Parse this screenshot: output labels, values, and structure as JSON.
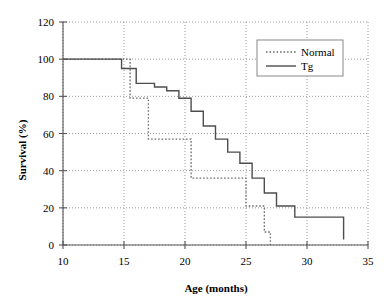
{
  "chart_data": {
    "type": "line",
    "title": "",
    "xlabel": "Age (months)",
    "ylabel": "Survival (%)",
    "xlim": [
      10,
      35
    ],
    "ylim": [
      0,
      120
    ],
    "xticks": [
      10,
      15,
      20,
      25,
      30,
      35
    ],
    "yticks": [
      0,
      20,
      40,
      60,
      80,
      100,
      120
    ],
    "grid": true,
    "legend_position": "top-right",
    "step_style": "post",
    "series": [
      {
        "name": "Normal",
        "style": "dotted",
        "color": "#6b6b6b",
        "x": [
          10,
          15,
          15.5,
          16,
          17,
          19,
          20.5,
          24,
          25,
          26,
          26.5,
          27
        ],
        "y": [
          100,
          100,
          79,
          79,
          57,
          57,
          36,
          36,
          21,
          21,
          7,
          0
        ]
      },
      {
        "name": "Tg",
        "style": "solid",
        "color": "#4d4d4d",
        "x": [
          10,
          14.8,
          16,
          17.5,
          18.5,
          19.5,
          20.5,
          21.5,
          22.5,
          23.5,
          24.5,
          25.5,
          26.5,
          27.5,
          29,
          33
        ],
        "y": [
          100,
          95,
          87,
          85,
          83,
          79,
          72,
          64,
          57,
          50,
          44,
          36,
          28,
          21,
          15,
          3
        ]
      }
    ]
  },
  "axes": {
    "y_tick_labels": [
      "0",
      "20",
      "40",
      "60",
      "80",
      "100",
      "120"
    ],
    "x_tick_labels": [
      "10",
      "15",
      "20",
      "25",
      "30",
      "35"
    ],
    "y_axis_title": "Survival (%)",
    "x_axis_title": "Age (months)"
  },
  "legend": {
    "entries": [
      {
        "label": "Normal",
        "marker": "dotted-line"
      },
      {
        "label": "Tg",
        "marker": "solid-line"
      }
    ]
  }
}
